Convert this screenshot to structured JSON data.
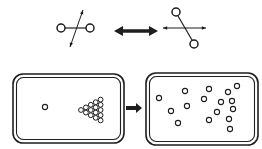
{
  "figure": {
    "width": 262,
    "height": 149,
    "background": "#ffffff",
    "ink": "#1e1e1e",
    "top": {
      "molecule_left": {
        "atoms": [
          {
            "x": 61,
            "y": 28,
            "r": 4.0
          },
          {
            "x": 90,
            "y": 28,
            "r": 4.0
          }
        ],
        "bond": {
          "x1": 65,
          "y1": 28,
          "x2": 86,
          "y2": 28
        },
        "rotation_arrow": {
          "x1": 83,
          "y1": 10,
          "x2": 70,
          "y2": 47
        }
      },
      "equilibrium_arrow": {
        "x1": 114,
        "y1": 31,
        "x2": 158,
        "y2": 31,
        "shaft": 3.6,
        "head_w": 9,
        "head_h": 10
      },
      "molecule_right": {
        "atoms": [
          {
            "x": 176,
            "y": 12,
            "r": 4.0
          },
          {
            "x": 194,
            "y": 44,
            "r": 4.0
          }
        ],
        "bond": {
          "x1": 178,
          "y1": 16,
          "x2": 192,
          "y2": 40
        },
        "rotation_arrow": {
          "x1": 163,
          "y1": 28,
          "x2": 206,
          "y2": 28
        }
      }
    },
    "bottom": {
      "box_ordered": {
        "x": 13,
        "y": 74,
        "w": 111,
        "h": 69,
        "rx": 10,
        "inner_inset": 3.5,
        "inner_rx": 7
      },
      "cue_ball": {
        "x": 45,
        "y": 107,
        "r": 2.6
      },
      "rack": {
        "apex_x": 81,
        "apex_y": 110,
        "cols": 5,
        "dx": 4.9,
        "dy": 5.2,
        "ball_r": 2.4
      },
      "break_arrow": {
        "x1": 126,
        "y1": 108,
        "x2": 142,
        "y2": 108,
        "shaft": 4,
        "head_w": 6,
        "head_h": 10
      },
      "box_disordered": {
        "x": 146,
        "y": 73,
        "w": 112,
        "h": 72,
        "rx": 10,
        "inner_inset": 3.5,
        "inner_rx": 7
      },
      "scattered_balls": {
        "r": 2.6,
        "points": [
          [
            159,
            98
          ],
          [
            185,
            91
          ],
          [
            209,
            89
          ],
          [
            228,
            92
          ],
          [
            237,
            86
          ],
          [
            204,
            99
          ],
          [
            187,
            106
          ],
          [
            221,
            102
          ],
          [
            232,
            101
          ],
          [
            171,
            111
          ],
          [
            217,
            112
          ],
          [
            233,
            109
          ],
          [
            178,
            123
          ],
          [
            209,
            120
          ],
          [
            229,
            119
          ],
          [
            230,
            129
          ]
        ]
      }
    }
  }
}
